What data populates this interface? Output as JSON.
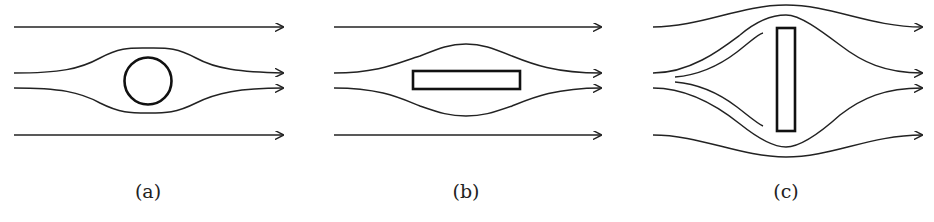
{
  "figure": {
    "panels": [
      {
        "id": "a",
        "label": "(a)",
        "obstacle": "circle",
        "caption_x": 148
      },
      {
        "id": "b",
        "label": "(b)",
        "obstacle": "flat plate parallel to flow",
        "caption_x": 466
      },
      {
        "id": "c",
        "label": "(c)",
        "obstacle": "flat plate perpendicular to flow",
        "caption_x": 786
      }
    ],
    "stroke_color": "#222222",
    "background": "#ffffff"
  }
}
